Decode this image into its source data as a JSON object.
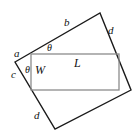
{
  "figure": {
    "colors": {
      "outer_stroke": "#1a1a1a",
      "inner_stroke": "#8c8c8c",
      "background": "#ffffff",
      "text": "#111111"
    },
    "outer_quad": {
      "name": "tilted-quadrilateral",
      "points": "15,62 100,13 131,90 55,129"
    },
    "inner_rect": {
      "name": "inscribed-rectangle",
      "x": 31,
      "y": 54,
      "width": 88,
      "height": 36
    },
    "labels": {
      "side_a": "a",
      "side_b": "b",
      "side_c": "c",
      "side_d_top": "d",
      "side_d_bottom": "d",
      "length": "L",
      "width": "W",
      "theta_top": "θ",
      "theta_left": "θ"
    }
  }
}
